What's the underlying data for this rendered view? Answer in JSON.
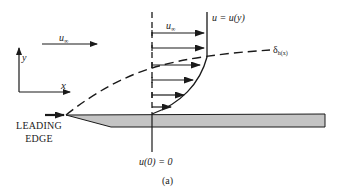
{
  "figure": {
    "caption": "(a)",
    "free_stream": {
      "symbol": "u",
      "subscript": "∞"
    },
    "profile_arrow_label": {
      "symbol": "u",
      "subscript": "∞"
    },
    "axes": {
      "x_label": "x",
      "y_label": "y"
    },
    "profile_label": "u = u(y)",
    "boundary_layer_label": {
      "symbol": "δ",
      "subscript": "h(x)"
    },
    "leading_edge_label": {
      "line1": "LEADING",
      "line2": "EDGE"
    },
    "wall_condition": "u(0) = 0",
    "colors": {
      "line": "#1a1a1a",
      "plate_fill": "#c4c4c4",
      "background": "#ffffff"
    },
    "velocity_arrows_count": 6
  }
}
